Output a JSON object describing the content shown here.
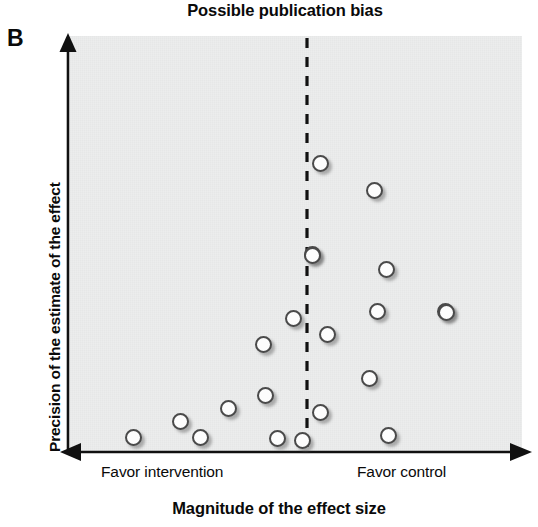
{
  "figure": {
    "panel_letter": "B",
    "title": "Possible publication bias",
    "xlabel": "Magnitude of the effect size",
    "ylabel": "Precision of the estimate of the effect",
    "axis_direction_left": "Favor intervention",
    "axis_direction_right": "Favor control",
    "colors": {
      "plot_background": "#eceded",
      "axis": "#111111",
      "marker_fill": "#fdfdfd",
      "marker_stroke": "#4a4a4a",
      "reference_line": "#111111",
      "text": "#0a0a0a"
    }
  },
  "chart_data": {
    "type": "scatter",
    "title": "Possible publication bias",
    "subtitle": "",
    "xlabel": "Magnitude of the effect size",
    "ylabel": "Precision of the estimate of the effect",
    "xlim": [
      0,
      1
    ],
    "ylim": [
      0,
      1
    ],
    "grid": false,
    "legend": "none",
    "axis_ticks": {
      "x": [],
      "y": []
    },
    "axis_annotations": [
      {
        "text": "Favor intervention",
        "side": "x-left"
      },
      {
        "text": "Favor control",
        "side": "x-right"
      }
    ],
    "reference_line": {
      "orientation": "vertical",
      "style": "dashed",
      "x_pixel": 307,
      "label": "no-effect line"
    },
    "marker": {
      "shape": "circle",
      "fill": "white",
      "edge": "dark-gray",
      "diameter_px": 17,
      "shadow": true
    },
    "n_points": 21,
    "points_pixel": [
      {
        "cx": 320,
        "cy": 163
      },
      {
        "cx": 374,
        "cy": 190
      },
      {
        "cx": 312,
        "cy": 254
      },
      {
        "cx": 386,
        "cy": 269
      },
      {
        "cx": 293,
        "cy": 318
      },
      {
        "cx": 377,
        "cy": 311
      },
      {
        "cx": 445,
        "cy": 311
      },
      {
        "cx": 327,
        "cy": 334
      },
      {
        "cx": 263,
        "cy": 344
      },
      {
        "cx": 369,
        "cy": 378
      },
      {
        "cx": 265,
        "cy": 395
      },
      {
        "cx": 228,
        "cy": 408
      },
      {
        "cx": 320,
        "cy": 412
      },
      {
        "cx": 180,
        "cy": 421
      },
      {
        "cx": 388,
        "cy": 435
      },
      {
        "cx": 133,
        "cy": 437
      },
      {
        "cx": 200,
        "cy": 437
      },
      {
        "cx": 277,
        "cy": 438
      },
      {
        "cx": 302,
        "cy": 440
      },
      {
        "cx": 446,
        "cy": 312
      },
      {
        "cx": 312,
        "cy": 255
      }
    ],
    "points_data": [
      {
        "x": 0.53,
        "y": 0.94
      },
      {
        "x": 0.65,
        "y": 0.88
      },
      {
        "x": 0.51,
        "y": 0.72
      },
      {
        "x": 0.68,
        "y": 0.69
      },
      {
        "x": 0.47,
        "y": 0.56
      },
      {
        "x": 0.66,
        "y": 0.58
      },
      {
        "x": 0.81,
        "y": 0.58
      },
      {
        "x": 0.55,
        "y": 0.53
      },
      {
        "x": 0.4,
        "y": 0.5
      },
      {
        "x": 0.63,
        "y": 0.42
      },
      {
        "x": 0.41,
        "y": 0.38
      },
      {
        "x": 0.33,
        "y": 0.35
      },
      {
        "x": 0.53,
        "y": 0.34
      },
      {
        "x": 0.23,
        "y": 0.32
      },
      {
        "x": 0.68,
        "y": 0.27
      },
      {
        "x": 0.13,
        "y": 0.26
      },
      {
        "x": 0.28,
        "y": 0.26
      },
      {
        "x": 0.45,
        "y": 0.26
      },
      {
        "x": 0.5,
        "y": 0.25
      },
      {
        "x": 0.81,
        "y": 0.58
      },
      {
        "x": 0.51,
        "y": 0.72
      }
    ]
  }
}
